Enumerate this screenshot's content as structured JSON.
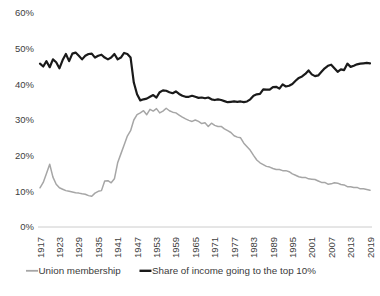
{
  "chart_data": {
    "type": "line",
    "title": "",
    "subtitle": "",
    "xlabel": "",
    "ylabel": "",
    "xlim": [
      1917,
      2019
    ],
    "ylim": [
      0,
      60
    ],
    "y_tick_labels": [
      "60%",
      "50%",
      "40%",
      "30%",
      "20%",
      "10%",
      "0%"
    ],
    "y_tick_values": [
      60,
      50,
      40,
      30,
      20,
      10,
      0
    ],
    "x_tick_labels": [
      "1917",
      "1923",
      "1929",
      "1935",
      "1941",
      "1947",
      "1953",
      "1959",
      "1965",
      "1971",
      "1977",
      "1983",
      "1989",
      "1995",
      "2001",
      "2007",
      "2013",
      "2019"
    ],
    "x_tick_values": [
      1917,
      1923,
      1929,
      1935,
      1941,
      1947,
      1953,
      1959,
      1965,
      1971,
      1977,
      1983,
      1989,
      1995,
      2001,
      2007,
      2013,
      2019
    ],
    "grid": false,
    "legend_position": "bottom",
    "x": [
      1917,
      1918,
      1919,
      1920,
      1921,
      1922,
      1923,
      1924,
      1925,
      1926,
      1927,
      1928,
      1929,
      1930,
      1931,
      1932,
      1933,
      1934,
      1935,
      1936,
      1937,
      1938,
      1939,
      1940,
      1941,
      1942,
      1943,
      1944,
      1945,
      1946,
      1947,
      1948,
      1949,
      1950,
      1951,
      1952,
      1953,
      1954,
      1955,
      1956,
      1957,
      1958,
      1959,
      1960,
      1961,
      1962,
      1963,
      1964,
      1965,
      1966,
      1967,
      1968,
      1969,
      1970,
      1971,
      1972,
      1973,
      1974,
      1975,
      1976,
      1977,
      1978,
      1979,
      1980,
      1981,
      1982,
      1983,
      1984,
      1985,
      1986,
      1987,
      1988,
      1989,
      1990,
      1991,
      1992,
      1993,
      1994,
      1995,
      1996,
      1997,
      1998,
      1999,
      2000,
      2001,
      2002,
      2003,
      2004,
      2005,
      2006,
      2007,
      2008,
      2009,
      2010,
      2011,
      2012,
      2013,
      2014,
      2015,
      2016,
      2017,
      2018,
      2019
    ],
    "series": [
      {
        "name": "Union membership",
        "color": "#a6a6a6",
        "units": "percent of workforce",
        "values": [
          11.0,
          12.5,
          15.0,
          17.6,
          14.0,
          12.0,
          11.0,
          10.6,
          10.2,
          10.0,
          9.8,
          9.6,
          9.5,
          9.3,
          9.2,
          8.8,
          8.6,
          9.5,
          10.0,
          10.2,
          12.9,
          13.0,
          12.4,
          13.5,
          18.0,
          20.5,
          23.0,
          25.5,
          27.0,
          30.0,
          31.5,
          32.0,
          32.6,
          31.5,
          33.0,
          32.5,
          33.2,
          32.0,
          32.5,
          33.3,
          32.6,
          32.2,
          32.0,
          31.4,
          30.8,
          30.3,
          29.9,
          29.6,
          30.0,
          29.6,
          29.0,
          29.2,
          28.2,
          29.1,
          28.5,
          28.2,
          28.2,
          27.5,
          27.0,
          26.5,
          25.6,
          25.2,
          25.0,
          23.5,
          22.5,
          21.5,
          20.1,
          18.8,
          18.0,
          17.5,
          17.0,
          16.8,
          16.4,
          16.1,
          16.1,
          15.8,
          15.8,
          15.5,
          14.9,
          14.5,
          14.1,
          13.9,
          13.9,
          13.5,
          13.4,
          13.3,
          12.9,
          12.5,
          12.5,
          12.0,
          12.1,
          12.4,
          12.3,
          11.9,
          11.8,
          11.3,
          11.3,
          11.1,
          11.1,
          10.7,
          10.7,
          10.5,
          10.3
        ]
      },
      {
        "name": "Share of income going to the top 10%",
        "color": "#1a1a1a",
        "units": "percent of total income",
        "values": [
          45.8,
          45.0,
          46.5,
          44.8,
          47.0,
          46.2,
          44.5,
          46.8,
          48.5,
          46.5,
          48.6,
          48.9,
          48.0,
          47.0,
          48.0,
          48.5,
          48.6,
          47.5,
          48.0,
          48.3,
          47.5,
          47.0,
          47.5,
          48.5,
          47.0,
          47.5,
          48.8,
          48.5,
          47.5,
          40.5,
          37.2,
          35.5,
          35.8,
          36.0,
          36.5,
          37.0,
          36.3,
          37.8,
          38.3,
          38.2,
          37.8,
          37.5,
          38.0,
          37.3,
          36.8,
          36.5,
          36.5,
          36.8,
          36.5,
          36.2,
          36.3,
          36.1,
          36.3,
          35.8,
          35.6,
          35.8,
          35.6,
          35.3,
          35.0,
          35.1,
          35.2,
          35.1,
          35.2,
          35.0,
          35.2,
          35.8,
          36.8,
          37.2,
          37.3,
          38.6,
          38.5,
          38.5,
          39.2,
          39.3,
          38.8,
          40.0,
          39.4,
          39.6,
          40.1,
          41.0,
          41.8,
          42.2,
          42.9,
          43.9,
          42.8,
          42.3,
          42.5,
          43.5,
          44.5,
          45.2,
          45.5,
          44.5,
          43.5,
          44.2,
          44.0,
          45.8,
          44.9,
          45.2,
          45.6,
          45.8,
          45.9,
          46.0,
          45.9
        ]
      }
    ],
    "legend": [
      {
        "label": "Union membership",
        "color": "#a6a6a6"
      },
      {
        "label": "Share of income going to the top 10%",
        "color": "#1a1a1a"
      }
    ]
  }
}
